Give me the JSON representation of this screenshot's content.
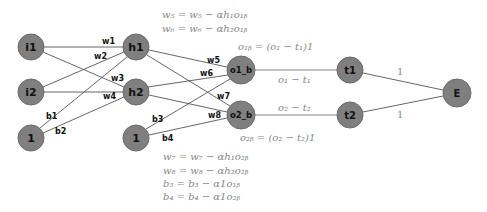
{
  "diagram": {
    "nodes": {
      "i1": {
        "label": "i1",
        "x": 31,
        "y": 47
      },
      "i2": {
        "label": "i2",
        "x": 31,
        "y": 92
      },
      "bias1": {
        "label": "1",
        "x": 31,
        "y": 138
      },
      "h1": {
        "label": "h1",
        "x": 136,
        "y": 47
      },
      "h2": {
        "label": "h2",
        "x": 136,
        "y": 92
      },
      "bias2": {
        "label": "1",
        "x": 136,
        "y": 138
      },
      "o1b": {
        "label": "o1_b",
        "x": 241,
        "y": 70
      },
      "o2b": {
        "label": "o2_b",
        "x": 241,
        "y": 115
      },
      "t1": {
        "label": "t1",
        "x": 350,
        "y": 70
      },
      "t2": {
        "label": "t2",
        "x": 350,
        "y": 115
      },
      "E": {
        "label": "E",
        "x": 457,
        "y": 93
      }
    },
    "weights": {
      "w1": "w1",
      "w2": "w2",
      "w3": "w3",
      "w4": "w4",
      "w5": "w5",
      "w6": "w6",
      "w7": "w7",
      "w8": "w8",
      "b1": "b1",
      "b2": "b2",
      "b3": "b3",
      "b4": "b4"
    },
    "edge_labels": {
      "o1_minus_t1": "o₁ − t₁",
      "o2_minus_t2": "o₂ − t₂",
      "t1_to_E": "1",
      "t2_to_E": "1"
    },
    "equations_top": [
      "w₅ = w₅ − αh₁o₁ᵦ",
      "w₆ = w₆ − αh₂o₁ᵦ"
    ],
    "o1b_eq": "o₁ᵦ = (o₁ − t₁)1",
    "o2b_eq": "o₂ᵦ = (o₂ − t₂)1",
    "equations_bottom": [
      "w₇ = w₇ − αh₁o₂ᵦ",
      "w₈ = w₈ − αh₂o₂ᵦ",
      "b₃ = b₃ − α1o₁ᵦ",
      "b₄ = b₄ − α1o₂ᵦ"
    ],
    "colors": {
      "node_fill": "#7f7f7f",
      "edge": "#555555",
      "math_text": "#888888"
    }
  }
}
